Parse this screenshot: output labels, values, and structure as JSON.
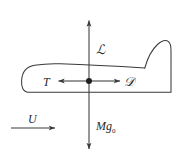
{
  "figure": {
    "background_color": "#ffffff",
    "stroke_color": "#3a3a3a",
    "text_color": "#2b2b2b",
    "width": 179,
    "height": 158
  },
  "labels": {
    "lift": "ℒ",
    "thrust": "T",
    "drag": "𝒟",
    "weight_symbol": "M",
    "weight_g": "g",
    "weight_subscript": "0",
    "freestream": "U"
  },
  "arrows": {
    "lift": {
      "name": "lift-arrow",
      "direction": "up",
      "from": [
        89,
        81
      ],
      "to": [
        89,
        19
      ]
    },
    "weight": {
      "name": "weight-arrow",
      "direction": "down",
      "from": [
        89,
        81
      ],
      "to": [
        89,
        150
      ]
    },
    "thrust": {
      "name": "thrust-arrow",
      "direction": "left",
      "from": [
        89,
        81
      ],
      "to": [
        57,
        81
      ]
    },
    "drag": {
      "name": "drag-arrow",
      "direction": "right",
      "from": [
        89,
        81
      ],
      "to": [
        121,
        81
      ]
    },
    "freestream": {
      "name": "freestream-arrow",
      "direction": "right",
      "from": [
        11,
        128
      ],
      "to": [
        56,
        128
      ]
    }
  },
  "center_of_mass": {
    "name": "center-of-mass-dot",
    "position": [
      89,
      81
    ],
    "radius": 3
  },
  "aircraft": {
    "name": "aircraft-silhouette",
    "description": "side view fuselage with rounded nose at left and vertical tail fin at right"
  }
}
